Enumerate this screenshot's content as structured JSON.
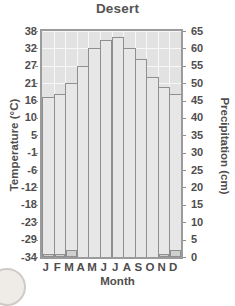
{
  "chart_data": {
    "type": "bar",
    "title": "Desert",
    "xlabel": "Month",
    "ylabel": "Temperature (°C)",
    "y2label": "Precipitation (cm)",
    "grid": true,
    "legend": "none",
    "categories": [
      "J",
      "F",
      "M",
      "A",
      "M",
      "J",
      "J",
      "A",
      "S",
      "O",
      "N",
      "D"
    ],
    "month_names": [
      "January",
      "February",
      "March",
      "April",
      "May",
      "June",
      "July",
      "August",
      "September",
      "October",
      "November",
      "December"
    ],
    "ytick_labels": [
      "38",
      "32",
      "27",
      "21",
      "16",
      "10",
      "5",
      "-1",
      "-6",
      "-12",
      "-18",
      "-23",
      "-29",
      "-34"
    ],
    "ytick_values": [
      38,
      32,
      27,
      21,
      16,
      10,
      5,
      -1,
      -6,
      -12,
      -18,
      -23,
      -29,
      -34
    ],
    "y2tick_labels": [
      "65",
      "60",
      "55",
      "50",
      "45",
      "40",
      "35",
      "30",
      "25",
      "20",
      "15",
      "10",
      "5",
      "0"
    ],
    "y2tick_values": [
      65,
      60,
      55,
      50,
      45,
      40,
      35,
      30,
      25,
      20,
      15,
      10,
      5,
      0
    ],
    "ylim": [
      -34,
      38
    ],
    "y2lim": [
      0,
      65
    ],
    "series": [
      {
        "name": "Temperature",
        "axis": "left",
        "style": "step",
        "unit": "°C",
        "values": [
          17,
          18,
          21,
          27,
          32,
          35,
          36,
          32,
          29,
          23,
          20,
          18
        ]
      },
      {
        "name": "Precipitation",
        "axis": "right",
        "style": "bar",
        "unit": "cm",
        "values": [
          1,
          1,
          2,
          0,
          0,
          0,
          0,
          0,
          0,
          0,
          1,
          2
        ]
      }
    ],
    "colors": {
      "plot_background": "#e2e2e2",
      "grid": "#f7f7f7",
      "axis_border": "#9b9b9b",
      "temperature_fill": "#e7e7e7",
      "temperature_line": "#8f8f8f",
      "precipitation_fill": "#cfcfcf",
      "text": "#4f4d4d"
    }
  }
}
